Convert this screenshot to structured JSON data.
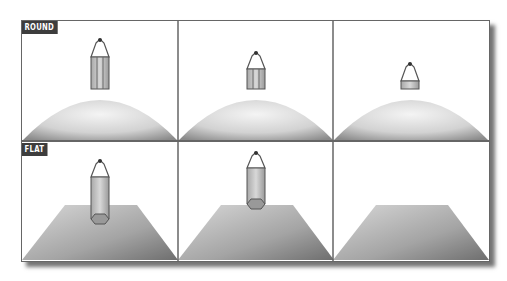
{
  "rows": [
    {
      "label": "ROUND",
      "surface": "dome"
    },
    {
      "label": "FLAT",
      "surface": "plane"
    }
  ],
  "panels": [
    {
      "row": 0,
      "col": 0,
      "pencil": "full",
      "surface": "dome"
    },
    {
      "row": 0,
      "col": 1,
      "pencil": "partial",
      "surface": "dome"
    },
    {
      "row": 0,
      "col": 2,
      "pencil": "tip-only",
      "surface": "dome"
    },
    {
      "row": 1,
      "col": 0,
      "pencil": "full-above",
      "surface": "plane"
    },
    {
      "row": 1,
      "col": 1,
      "pencil": "touching",
      "surface": "plane"
    },
    {
      "row": 1,
      "col": 2,
      "pencil": "none",
      "surface": "plane"
    }
  ],
  "colors": {
    "frame": "#666666",
    "tag_bg": "#3d3d3d",
    "tag_text": "#ffffff",
    "surface_light": "#f2f2f2",
    "surface_dark": "#7a7a7a"
  }
}
